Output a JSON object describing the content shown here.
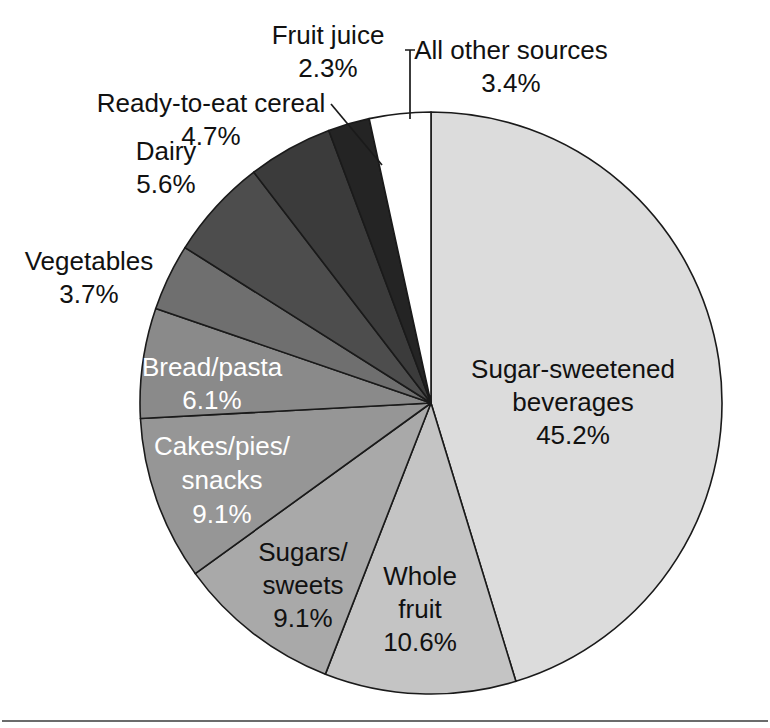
{
  "chart_data": {
    "type": "pie",
    "title": "",
    "subtitle": "",
    "xlabel": "",
    "ylabel": "",
    "legend_position": "none",
    "grid": false,
    "units": "percent",
    "total": 100.0,
    "start_angle_deg": 90,
    "direction": "clockwise",
    "categories": [
      "Sugar-sweetened beverages",
      "Whole fruit",
      "Sugars/sweets",
      "Cakes/pies/snacks",
      "Bread/pasta",
      "Vegetables",
      "Dairy",
      "Ready-to-eat cereal",
      "Fruit juice",
      "All other sources"
    ],
    "values": [
      45.2,
      10.6,
      9.1,
      9.1,
      6.1,
      3.7,
      5.6,
      4.7,
      2.3,
      3.4
    ],
    "slices": [
      {
        "label": "Sugar-sweetened beverages",
        "label_line1": "Sugar-sweetened",
        "label_line2": "beverages",
        "value": 45.2,
        "value_text": "45.2%",
        "color": "#dcdcdc",
        "label_placement": "inside",
        "label_color": "dark"
      },
      {
        "label": "Whole fruit",
        "label_line1": "Whole",
        "label_line2": "fruit",
        "value": 10.6,
        "value_text": "10.6%",
        "color": "#c4c4c4",
        "label_placement": "inside",
        "label_color": "dark"
      },
      {
        "label": "Sugars/sweets",
        "label_line1": "Sugars/",
        "label_line2": "sweets",
        "value": 9.1,
        "value_text": "9.1%",
        "color": "#a9a9a9",
        "label_placement": "inside",
        "label_color": "dark"
      },
      {
        "label": "Cakes/pies/snacks",
        "label_line1": "Cakes/pies/",
        "label_line2": "snacks",
        "value": 9.1,
        "value_text": "9.1%",
        "color": "#969696",
        "label_placement": "inside",
        "label_color": "light"
      },
      {
        "label": "Bread/pasta",
        "label_line1": "Bread/pasta",
        "label_line2": "",
        "value": 6.1,
        "value_text": "6.1%",
        "color": "#8a8a8a",
        "label_placement": "inside",
        "label_color": "light"
      },
      {
        "label": "Vegetables",
        "label_line1": "Vegetables",
        "label_line2": "",
        "value": 3.7,
        "value_text": "3.7%",
        "color": "#6f6f6f",
        "label_placement": "outside",
        "label_color": "dark"
      },
      {
        "label": "Dairy",
        "label_line1": "Dairy",
        "label_line2": "",
        "value": 5.6,
        "value_text": "5.6%",
        "color": "#4d4d4d",
        "label_placement": "outside",
        "label_color": "dark"
      },
      {
        "label": "Ready-to-eat cereal",
        "label_line1": "Ready-to-eat cereal",
        "label_line2": "",
        "value": 4.7,
        "value_text": "4.7%",
        "color": "#3b3b3b",
        "label_placement": "outside",
        "label_color": "dark"
      },
      {
        "label": "Fruit juice",
        "label_line1": "Fruit juice",
        "label_line2": "",
        "value": 2.3,
        "value_text": "2.3%",
        "color": "#242424",
        "label_placement": "outside-leader",
        "label_color": "dark"
      },
      {
        "label": "All other sources",
        "label_line1": "All other sources",
        "label_line2": "",
        "value": 3.4,
        "value_text": "3.4%",
        "color": "#ffffff",
        "label_placement": "outside-leader",
        "label_color": "dark"
      }
    ]
  },
  "labels": {
    "sugar_sweetened_l1": "Sugar-sweetened",
    "sugar_sweetened_l2": "beverages",
    "sugar_sweetened_pct": "45.2%",
    "whole_fruit_l1": "Whole",
    "whole_fruit_l2": "fruit",
    "whole_fruit_pct": "10.6%",
    "sugars_sweets_l1": "Sugars/",
    "sugars_sweets_l2": "sweets",
    "sugars_sweets_pct": "9.1%",
    "cakes_l1": "Cakes/pies/",
    "cakes_l2": "snacks",
    "cakes_pct": "9.1%",
    "bread_l1": "Bread/pasta",
    "bread_pct": "6.1%",
    "vegetables_l1": "Vegetables",
    "vegetables_pct": "3.7%",
    "dairy_l1": "Dairy",
    "dairy_pct": "5.6%",
    "cereal_l1": "Ready-to-eat cereal",
    "cereal_pct": "4.7%",
    "juice_l1": "Fruit juice",
    "juice_pct": "2.3%",
    "other_l1": "All other sources",
    "other_pct": "3.4%"
  },
  "geometry": {
    "cx": 431,
    "cy": 403,
    "r": 291
  }
}
